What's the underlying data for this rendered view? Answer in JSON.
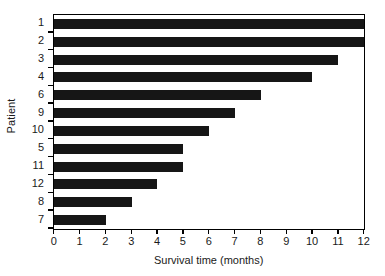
{
  "chart_data": {
    "type": "bar",
    "orientation": "horizontal",
    "title": "",
    "xlabel": "Survival time (months)",
    "ylabel": "Patient",
    "categories": [
      "1",
      "2",
      "3",
      "4",
      "6",
      "9",
      "10",
      "5",
      "11",
      "12",
      "8",
      "7"
    ],
    "values": [
      12,
      12,
      11,
      10,
      8,
      7,
      6,
      5,
      5,
      4,
      3,
      2
    ],
    "series": [
      {
        "name": "Survival time",
        "values": [
          12,
          12,
          11,
          10,
          8,
          7,
          6,
          5,
          5,
          4,
          3,
          2
        ]
      }
    ],
    "xlim": [
      0,
      12
    ],
    "xticks": [
      0,
      1,
      2,
      3,
      4,
      5,
      6,
      7,
      8,
      9,
      10,
      11,
      12
    ],
    "xtick_labels": [
      "0",
      "1",
      "2",
      "3",
      "4",
      "5",
      "6",
      "7",
      "8",
      "9",
      "10",
      "11",
      "12"
    ],
    "grid": false,
    "legend": false,
    "bar_color": "#161616",
    "frame_color": "#000000",
    "background_color": "#ffffff"
  }
}
